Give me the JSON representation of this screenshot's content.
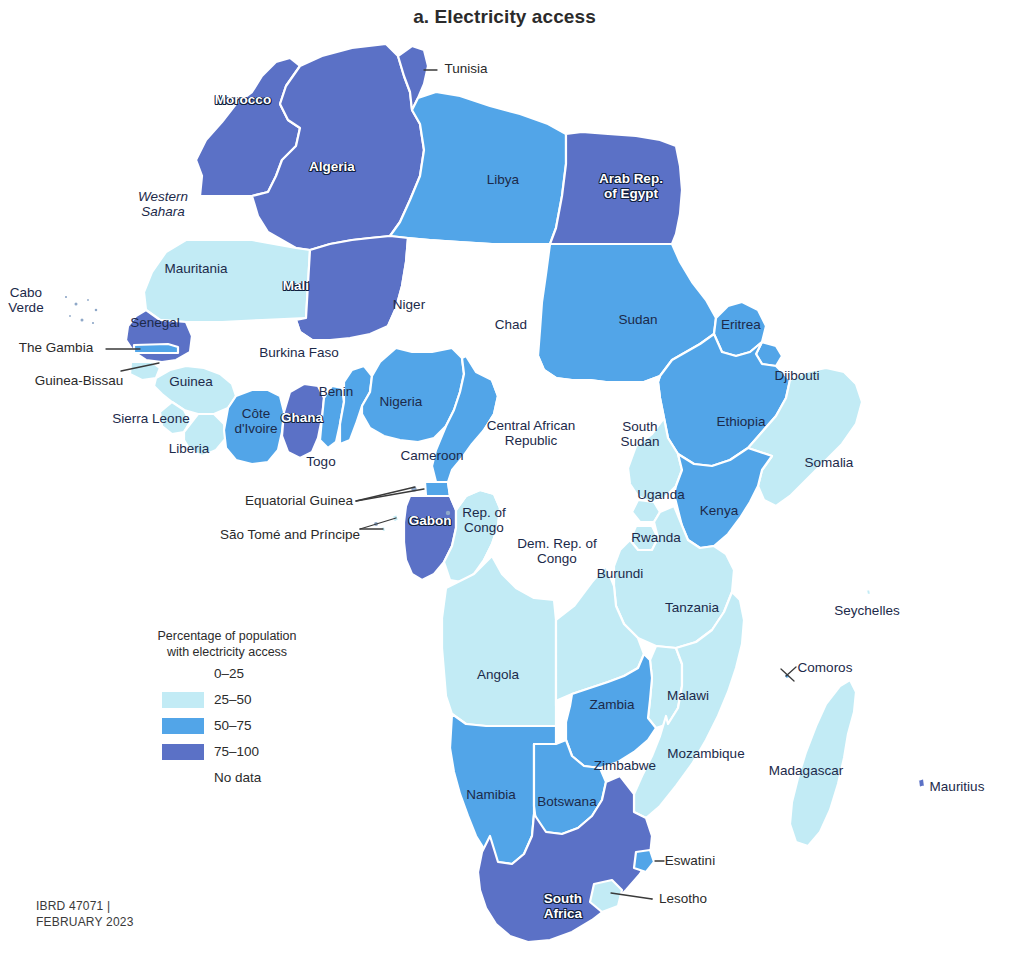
{
  "title": "a. Electricity access",
  "credits": "IBRD 47071 |\nFEBRUARY 2023",
  "colors": {
    "c0_25": "#ffffff",
    "c25_50": "#c2ebf5",
    "c50_75": "#52a5e8",
    "c75_100": "#5b71c6",
    "no_data": "#ffffff",
    "border": "#ffffff",
    "outline": "#bcd9ea",
    "label_dark": "#1c2a4a",
    "label_light": "#ffffff",
    "leader_line": "#3a3a3a"
  },
  "legend": {
    "title": "Percentage of population\nwith electricity access",
    "entries": [
      {
        "label": "0–25",
        "color": "#ffffff"
      },
      {
        "label": "25–50",
        "color": "#c2ebf5"
      },
      {
        "label": "50–75",
        "color": "#52a5e8"
      },
      {
        "label": "75–100",
        "color": "#5b71c6"
      },
      {
        "label": "No data",
        "color": "#ffffff"
      }
    ]
  },
  "chart_data": {
    "type": "map",
    "title": "a. Electricity access",
    "measure": "Percentage of population with electricity access",
    "region": "Africa",
    "classes": [
      "0–25",
      "25–50",
      "50–75",
      "75–100",
      "No data"
    ],
    "legend_position": "lower-left",
    "countries": [
      {
        "name": "Morocco",
        "class": "75–100"
      },
      {
        "name": "Algeria",
        "class": "75–100"
      },
      {
        "name": "Tunisia",
        "class": "75–100"
      },
      {
        "name": "Libya",
        "class": "50–75"
      },
      {
        "name": "Arab Rep. of Egypt",
        "class": "75–100"
      },
      {
        "name": "Western Sahara",
        "class": "No data"
      },
      {
        "name": "Mauritania",
        "class": "25–50"
      },
      {
        "name": "Mali",
        "class": "75–100"
      },
      {
        "name": "Niger",
        "class": "0–25"
      },
      {
        "name": "Chad",
        "class": "0–25"
      },
      {
        "name": "Sudan",
        "class": "50–75"
      },
      {
        "name": "Eritrea",
        "class": "50–75"
      },
      {
        "name": "Djibouti",
        "class": "50–75"
      },
      {
        "name": "Ethiopia",
        "class": "50–75"
      },
      {
        "name": "Somalia",
        "class": "25–50"
      },
      {
        "name": "Senegal",
        "class": "75–100"
      },
      {
        "name": "The Gambia",
        "class": "50–75"
      },
      {
        "name": "Guinea-Bissau",
        "class": "25–50"
      },
      {
        "name": "Guinea",
        "class": "25–50"
      },
      {
        "name": "Sierra Leone",
        "class": "25–50"
      },
      {
        "name": "Liberia",
        "class": "25–50"
      },
      {
        "name": "Côte d'Ivoire",
        "class": "50–75"
      },
      {
        "name": "Burkina Faso",
        "class": "0–25"
      },
      {
        "name": "Ghana",
        "class": "75–100"
      },
      {
        "name": "Togo",
        "class": "50–75"
      },
      {
        "name": "Benin",
        "class": "50–75"
      },
      {
        "name": "Nigeria",
        "class": "50–75"
      },
      {
        "name": "Cameroon",
        "class": "50–75"
      },
      {
        "name": "Central African Republic",
        "class": "0–25"
      },
      {
        "name": "South Sudan",
        "class": "0–25"
      },
      {
        "name": "Equatorial Guinea",
        "class": "50–75"
      },
      {
        "name": "São Tomé and Príncipe",
        "class": "25–50"
      },
      {
        "name": "Gabon",
        "class": "75–100"
      },
      {
        "name": "Rep. of Congo",
        "class": "25–50"
      },
      {
        "name": "Dem. Rep. of Congo",
        "class": "0–25"
      },
      {
        "name": "Uganda",
        "class": "25–50"
      },
      {
        "name": "Rwanda",
        "class": "25–50"
      },
      {
        "name": "Burundi",
        "class": "25–50"
      },
      {
        "name": "Kenya",
        "class": "50–75"
      },
      {
        "name": "Tanzania",
        "class": "25–50"
      },
      {
        "name": "Angola",
        "class": "25–50"
      },
      {
        "name": "Zambia",
        "class": "25–50"
      },
      {
        "name": "Malawi",
        "class": "25–50"
      },
      {
        "name": "Mozambique",
        "class": "25–50"
      },
      {
        "name": "Zimbabwe",
        "class": "50–75"
      },
      {
        "name": "Namibia",
        "class": "50–75"
      },
      {
        "name": "Botswana",
        "class": "50–75"
      },
      {
        "name": "South Africa",
        "class": "75–100"
      },
      {
        "name": "Eswatini",
        "class": "50–75"
      },
      {
        "name": "Lesotho",
        "class": "25–50"
      },
      {
        "name": "Madagascar",
        "class": "25–50"
      },
      {
        "name": "Comoros",
        "class": "25–50"
      },
      {
        "name": "Seychelles",
        "class": "No data"
      },
      {
        "name": "Mauritius",
        "class": "75–100"
      },
      {
        "name": "Cabo Verde",
        "class": "No data"
      }
    ]
  },
  "labels": [
    {
      "key": "tunisia",
      "text": "Tunisia",
      "x": 466,
      "y": 69,
      "style": "lead"
    },
    {
      "key": "morocco",
      "text": "Morocco",
      "x": 243,
      "y": 100,
      "style": "onfill"
    },
    {
      "key": "algeria",
      "text": "Algeria",
      "x": 332,
      "y": 167,
      "style": "onfill"
    },
    {
      "key": "libya",
      "text": "Libya",
      "x": 503,
      "y": 180,
      "style": "dark"
    },
    {
      "key": "egypt",
      "text": "Arab Rep.\nof Egypt",
      "x": 631,
      "y": 186,
      "style": "onfill"
    },
    {
      "key": "wsahara",
      "text": "Western\nSahara",
      "x": 163,
      "y": 204,
      "style": "italic"
    },
    {
      "key": "mauritania",
      "text": "Mauritania",
      "x": 196,
      "y": 269,
      "style": "dark"
    },
    {
      "key": "mali",
      "text": "Mali",
      "x": 296,
      "y": 286,
      "style": "onfill"
    },
    {
      "key": "niger",
      "text": "Niger",
      "x": 409,
      "y": 305,
      "style": "dark"
    },
    {
      "key": "chad",
      "text": "Chad",
      "x": 511,
      "y": 325,
      "style": "dark"
    },
    {
      "key": "sudan",
      "text": "Sudan",
      "x": 638,
      "y": 320,
      "style": "dark"
    },
    {
      "key": "eritrea",
      "text": "Eritrea",
      "x": 741,
      "y": 325,
      "style": "dark"
    },
    {
      "key": "caboverde",
      "text": "Cabo\nVerde",
      "x": 26,
      "y": 300,
      "style": "dark"
    },
    {
      "key": "senegal",
      "text": "Senegal",
      "x": 155,
      "y": 323,
      "style": "dark"
    },
    {
      "key": "gambia",
      "text": "The Gambia",
      "x": 56,
      "y": 348,
      "style": "lead"
    },
    {
      "key": "burkina",
      "text": "Burkina Faso",
      "x": 299,
      "y": 353,
      "style": "dark"
    },
    {
      "key": "djibouti",
      "text": "Djibouti",
      "x": 797,
      "y": 376,
      "style": "dark"
    },
    {
      "key": "gbissau",
      "text": "Guinea-Bissau",
      "x": 79,
      "y": 381,
      "style": "lead"
    },
    {
      "key": "guinea",
      "text": "Guinea",
      "x": 191,
      "y": 382,
      "style": "dark"
    },
    {
      "key": "benin",
      "text": "Benin",
      "x": 336,
      "y": 392,
      "style": "dark"
    },
    {
      "key": "nigeria",
      "text": "Nigeria",
      "x": 401,
      "y": 402,
      "style": "dark"
    },
    {
      "key": "sierraleone",
      "text": "Sierra Leone",
      "x": 151,
      "y": 419,
      "style": "dark"
    },
    {
      "key": "cotedivoire",
      "text": "Côte\nd'Ivoire",
      "x": 256,
      "y": 421,
      "style": "dark"
    },
    {
      "key": "ghana",
      "text": "Ghana",
      "x": 302,
      "y": 418,
      "style": "onfill"
    },
    {
      "key": "car",
      "text": "Central African\nRepublic",
      "x": 531,
      "y": 433,
      "style": "dark"
    },
    {
      "key": "southsudan",
      "text": "South\nSudan",
      "x": 640,
      "y": 434,
      "style": "dark"
    },
    {
      "key": "ethiopia",
      "text": "Ethiopia",
      "x": 741,
      "y": 422,
      "style": "dark"
    },
    {
      "key": "liberia",
      "text": "Liberia",
      "x": 189,
      "y": 449,
      "style": "dark"
    },
    {
      "key": "togo",
      "text": "Togo",
      "x": 321,
      "y": 462,
      "style": "dark"
    },
    {
      "key": "cameroon",
      "text": "Cameroon",
      "x": 432,
      "y": 456,
      "style": "dark"
    },
    {
      "key": "somalia",
      "text": "Somalia",
      "x": 829,
      "y": 463,
      "style": "dark"
    },
    {
      "key": "uganda",
      "text": "Uganda",
      "x": 661,
      "y": 495,
      "style": "dark"
    },
    {
      "key": "eqguinea",
      "text": "Equatorial Guinea",
      "x": 299,
      "y": 501,
      "style": "lead"
    },
    {
      "key": "kenya",
      "text": "Kenya",
      "x": 719,
      "y": 511,
      "style": "dark"
    },
    {
      "key": "gabon",
      "text": "Gabon",
      "x": 430,
      "y": 521,
      "style": "onfill"
    },
    {
      "key": "repcongo",
      "text": "Rep. of\nCongo",
      "x": 484,
      "y": 520,
      "style": "dark"
    },
    {
      "key": "saotome",
      "text": "São Tomé and Príncipe",
      "x": 290,
      "y": 535,
      "style": "lead"
    },
    {
      "key": "drc",
      "text": "Dem. Rep. of\nCongo",
      "x": 557,
      "y": 551,
      "style": "dark"
    },
    {
      "key": "rwanda",
      "text": "Rwanda",
      "x": 656,
      "y": 538,
      "style": "dark"
    },
    {
      "key": "burundi",
      "text": "Burundi",
      "x": 620,
      "y": 574,
      "style": "dark"
    },
    {
      "key": "tanzania",
      "text": "Tanzania",
      "x": 692,
      "y": 608,
      "style": "dark"
    },
    {
      "key": "seychelles",
      "text": "Seychelles",
      "x": 867,
      "y": 611,
      "style": "dark"
    },
    {
      "key": "comoros",
      "text": "Comoros",
      "x": 825,
      "y": 668,
      "style": "dark"
    },
    {
      "key": "angola",
      "text": "Angola",
      "x": 498,
      "y": 675,
      "style": "dark"
    },
    {
      "key": "zambia",
      "text": "Zambia",
      "x": 612,
      "y": 705,
      "style": "dark"
    },
    {
      "key": "malawi",
      "text": "Malawi",
      "x": 688,
      "y": 696,
      "style": "dark"
    },
    {
      "key": "mozambique",
      "text": "Mozambique",
      "x": 706,
      "y": 754,
      "style": "dark"
    },
    {
      "key": "zimbabwe",
      "text": "Zimbabwe",
      "x": 625,
      "y": 766,
      "style": "dark"
    },
    {
      "key": "madagascar",
      "text": "Madagascar",
      "x": 806,
      "y": 771,
      "style": "dark"
    },
    {
      "key": "mauritius",
      "text": "Mauritius",
      "x": 957,
      "y": 787,
      "style": "dark"
    },
    {
      "key": "namibia",
      "text": "Namibia",
      "x": 491,
      "y": 795,
      "style": "dark"
    },
    {
      "key": "botswana",
      "text": "Botswana",
      "x": 567,
      "y": 802,
      "style": "dark"
    },
    {
      "key": "eswatini",
      "text": "Eswatini",
      "x": 690,
      "y": 861,
      "style": "lead"
    },
    {
      "key": "lesotho",
      "text": "Lesotho",
      "x": 683,
      "y": 899,
      "style": "lead"
    },
    {
      "key": "southafrica",
      "text": "South\nAfrica",
      "x": 563,
      "y": 906,
      "style": "onfill"
    }
  ]
}
